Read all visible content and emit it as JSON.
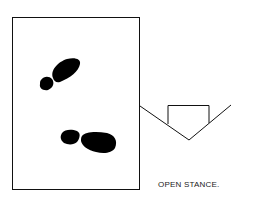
{
  "diagram": {
    "caption": "OPEN STANCE.",
    "elements": {
      "batters_box": "rectangle",
      "front_foot": "footprint (upper, angled toward plate)",
      "back_foot": "footprint (lower, horizontal)",
      "home_plate": "pentagon outline with foul lines"
    },
    "colors": {
      "ink": "#000000",
      "background": "#ffffff"
    }
  }
}
